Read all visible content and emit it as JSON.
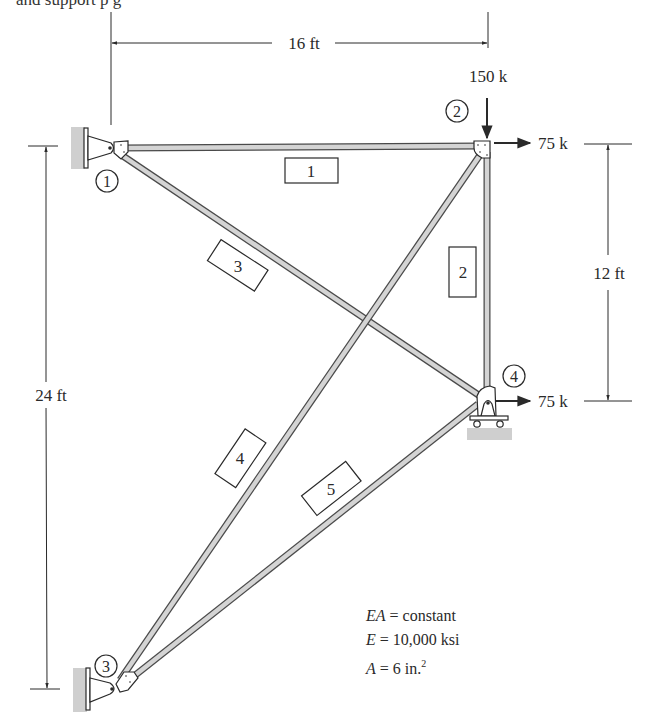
{
  "caption_fragment": "and support                                     p                                        g",
  "dimensions": {
    "top_span": "16 ft",
    "right_span": "12 ft",
    "left_span": "24 ft"
  },
  "loads": {
    "joint2_vertical": "150 k",
    "joint2_horizontal": "75 k",
    "joint4_horizontal": "75 k"
  },
  "joints": [
    {
      "id": "1",
      "label": "1",
      "support": "pin"
    },
    {
      "id": "2",
      "label": "2",
      "support": "none"
    },
    {
      "id": "3",
      "label": "3",
      "support": "pin"
    },
    {
      "id": "4",
      "label": "4",
      "support": "roller"
    }
  ],
  "members": [
    {
      "label": "1",
      "from": "1",
      "to": "2"
    },
    {
      "label": "2",
      "from": "2",
      "to": "4"
    },
    {
      "label": "3",
      "from": "1",
      "to": "4"
    },
    {
      "label": "4",
      "from": "3",
      "to": "2"
    },
    {
      "label": "5",
      "from": "3",
      "to": "4"
    }
  ],
  "properties": {
    "line1_var": "EA",
    "line1_rest": " = constant",
    "line2_var": "E",
    "line2_rest": " = 10,000 ksi",
    "line3_var": "A",
    "line3_rest": " = 6 in.",
    "line3_sup": "2"
  },
  "colors": {
    "member_fill": "#d4d4d4",
    "member_stroke": "#4a4a4a",
    "ground_hatch": "#cfcfcf",
    "ink": "#2a2a2a"
  }
}
